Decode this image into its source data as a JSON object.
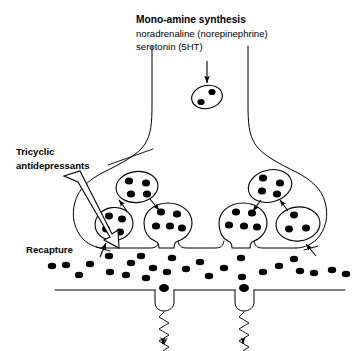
{
  "figure": {
    "background_color": "#ffffff",
    "ink_color": "#000000"
  },
  "labels": {
    "synthesis_heading": "Mono-amine synthesis",
    "synthesis_line1": "noradrenaline (norepinephrine)",
    "synthesis_line2": "serotonin (5HT)",
    "tricyclic_line1": "Tricyclic",
    "tricyclic_line2": "antidepressants",
    "recapture": "Recapture"
  },
  "diagram_data": {
    "type": "diagram",
    "subject": "synaptic neurotransmission and tricyclic antidepressant action",
    "neuron": {
      "description": "presynaptic axon terminal flaring into two boutons above a synaptic cleft",
      "axon_left_x": 152,
      "axon_right_x": 248,
      "presynaptic_membrane_y": 248,
      "postsynaptic_membrane_y": 290
    },
    "synthesis_vesicle": {
      "label": "newly synthesised mono-amine vesicle",
      "cx": 207,
      "cy": 97,
      "rx": 15,
      "ry": 11,
      "granule_count": 2
    },
    "synthesis_arrow": {
      "from_y": 62,
      "to_y": 84,
      "x": 207,
      "direction": "down"
    },
    "vesicle_clusters": [
      {
        "side": "left",
        "vesicles": [
          {
            "position": "top",
            "cx": 137,
            "cy": 187,
            "rx": 21,
            "ry": 15,
            "granule_count": 4,
            "fusing": false
          },
          {
            "position": "lower-left",
            "cx": 114,
            "cy": 224,
            "rx": 19,
            "ry": 16,
            "granule_count": 4,
            "fusing": false
          },
          {
            "position": "lower-right",
            "cx": 168,
            "cy": 222,
            "rx": 24,
            "ry": 19,
            "granule_count": 5,
            "fusing": true
          }
        ],
        "arrows": [
          {
            "from": "top-vesicle",
            "to": "lower-left-vesicle",
            "direction": "up-left"
          },
          {
            "from": "top-vesicle",
            "to": "lower-right-vesicle",
            "direction": "down-right"
          }
        ]
      },
      {
        "side": "right",
        "vesicles": [
          {
            "position": "top",
            "cx": 270,
            "cy": 186,
            "rx": 22,
            "ry": 16,
            "granule_count": 4,
            "fusing": false
          },
          {
            "position": "lower-left",
            "cx": 243,
            "cy": 224,
            "rx": 24,
            "ry": 19,
            "granule_count": 5,
            "fusing": true
          },
          {
            "position": "lower-right",
            "cx": 298,
            "cy": 224,
            "rx": 22,
            "ry": 17,
            "granule_count": 4,
            "fusing": false
          }
        ],
        "arrows": [
          {
            "from": "top-vesicle",
            "to": "lower-left-vesicle",
            "direction": "down-left"
          },
          {
            "from": "top-vesicle",
            "to": "lower-right-vesicle",
            "direction": "up-right"
          }
        ]
      }
    ],
    "cleft_transmitter_count": 26,
    "recapture_blockers": [
      {
        "side": "left",
        "x": 104,
        "y": 249,
        "direction": "up-right",
        "blocked": true
      },
      {
        "side": "right",
        "x": 309,
        "y": 249,
        "direction": "up-left",
        "blocked": true
      }
    ],
    "receptors": [
      {
        "index": 1,
        "x": 163,
        "bound_transmitter": true,
        "signal": "zigzag with downward arrow"
      },
      {
        "index": 2,
        "x": 243,
        "bound_transmitter": true,
        "signal": "zigzag with downward arrow"
      }
    ],
    "tricyclic_pointer": {
      "style": "hollow block arrow",
      "from": [
        72,
        178
      ],
      "to": [
        118,
        248
      ],
      "target": "recapture site on presynaptic membrane"
    },
    "tricyclic_leader_line": {
      "from": [
        110,
        166
      ],
      "to": [
        152,
        150
      ],
      "target": "presynaptic terminal outline"
    }
  }
}
